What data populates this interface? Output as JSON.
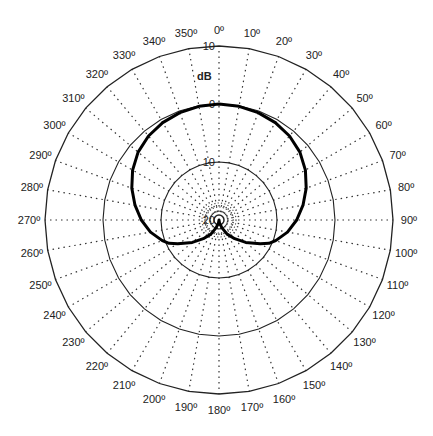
{
  "chart_data": {
    "type": "polar",
    "title": "",
    "unit_label": "dB",
    "radial_axis": {
      "range": [
        -20,
        10
      ],
      "rings": [
        10,
        0,
        -10,
        -20
      ],
      "ring_labels": [
        "10",
        "0",
        "10",
        "20"
      ],
      "inner_minor_rings": 3
    },
    "angular_axis": {
      "step_deg": 10,
      "tick_labels": [
        "0º",
        "10º",
        "20º",
        "30º",
        "40º",
        "50º",
        "60º",
        "70º",
        "80º",
        "90º",
        "100º",
        "110º",
        "120º",
        "130º",
        "140º",
        "150º",
        "160º",
        "170º",
        "180º",
        "190º",
        "200º",
        "210º",
        "220º",
        "230º",
        "240º",
        "250º",
        "260º",
        "270º",
        "280º",
        "290º",
        "300º",
        "310º",
        "320º",
        "330º",
        "340º",
        "350º"
      ],
      "direction": "clockwise",
      "zero_at": "top"
    },
    "grid": true,
    "series": [
      {
        "name": "pattern",
        "angles_deg": [
          0,
          10,
          20,
          30,
          40,
          50,
          60,
          70,
          80,
          90,
          100,
          110,
          115,
          120,
          130,
          140,
          150,
          160,
          170,
          180,
          190,
          200,
          210,
          220,
          230,
          240,
          245,
          250,
          260,
          270,
          280,
          290,
          300,
          310,
          320,
          330,
          340,
          350
        ],
        "values_db": [
          0,
          -0.1,
          -0.3,
          -0.6,
          -1.1,
          -1.8,
          -2.8,
          -4.0,
          -5.3,
          -6.6,
          -8.0,
          -9.6,
          -10.5,
          -11.8,
          -14.0,
          -15.8,
          -17.2,
          -18.6,
          -19.5,
          -20,
          -19.5,
          -18.6,
          -17.2,
          -15.8,
          -14.0,
          -11.8,
          -10.5,
          -9.6,
          -8.0,
          -6.6,
          -5.3,
          -4.0,
          -2.8,
          -1.8,
          -1.1,
          -0.6,
          -0.3,
          -0.1
        ]
      }
    ]
  }
}
